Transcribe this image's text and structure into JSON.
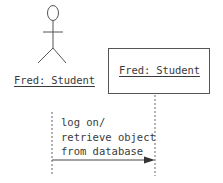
{
  "diagram": {
    "type": "UML sequence diagram",
    "colors": {
      "line": "#555555",
      "text": "#3a3a3a",
      "background": "#ffffff"
    },
    "actor": {
      "icon": "stick-figure-icon",
      "label": "Fred: Student"
    },
    "object": {
      "label": "Fred: Student"
    },
    "message": {
      "lines": [
        "log on/",
        "retrieve object",
        "from database"
      ],
      "direction": "actor-to-object",
      "arrow": "synchronous-filled"
    }
  }
}
